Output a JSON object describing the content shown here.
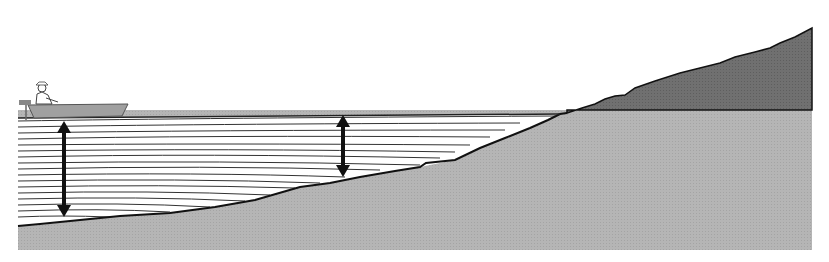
{
  "diagram": {
    "title": "",
    "colors": {
      "background": "#ffffff",
      "ground": "#b3b3b3",
      "hill": "#6e6e6e",
      "water": "#ffffff",
      "water_lines": "#3a3a3a",
      "outline": "#111111",
      "arrow": "#111111",
      "boat": "#9a9a9a"
    },
    "water_surface_y": 118,
    "elements": [
      {
        "name": "boat-with-fisherman",
        "x": 20,
        "y": 75
      },
      {
        "name": "depth-arrow-deep",
        "x": 64,
        "y_top": 121,
        "y_bottom": 217
      },
      {
        "name": "depth-arrow-shallow",
        "x": 343,
        "y_top": 115,
        "y_bottom": 177
      },
      {
        "name": "shoreline",
        "x": 560,
        "y": 114
      },
      {
        "name": "hill",
        "x_start": 570,
        "x_end": 812,
        "peak_y": 25
      }
    ]
  }
}
